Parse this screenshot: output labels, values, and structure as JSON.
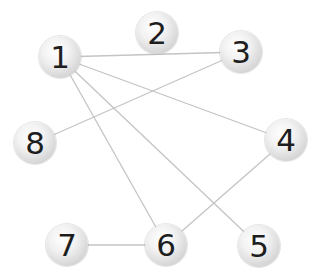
{
  "diagram": {
    "type": "undirected-graph",
    "edge_color": "#c4c4c4",
    "nodes": [
      {
        "id": "1",
        "label": "1",
        "x": 60,
        "y": 57
      },
      {
        "id": "2",
        "label": "2",
        "x": 157,
        "y": 33
      },
      {
        "id": "3",
        "label": "3",
        "x": 241,
        "y": 52
      },
      {
        "id": "4",
        "label": "4",
        "x": 286,
        "y": 140
      },
      {
        "id": "5",
        "label": "5",
        "x": 259,
        "y": 246
      },
      {
        "id": "6",
        "label": "6",
        "x": 166,
        "y": 245
      },
      {
        "id": "7",
        "label": "7",
        "x": 67,
        "y": 245
      },
      {
        "id": "8",
        "label": "8",
        "x": 35,
        "y": 143
      }
    ],
    "edges": [
      [
        "1",
        "3"
      ],
      [
        "1",
        "4"
      ],
      [
        "1",
        "5"
      ],
      [
        "1",
        "6"
      ],
      [
        "8",
        "3"
      ],
      [
        "7",
        "6"
      ],
      [
        "6",
        "4"
      ]
    ]
  }
}
